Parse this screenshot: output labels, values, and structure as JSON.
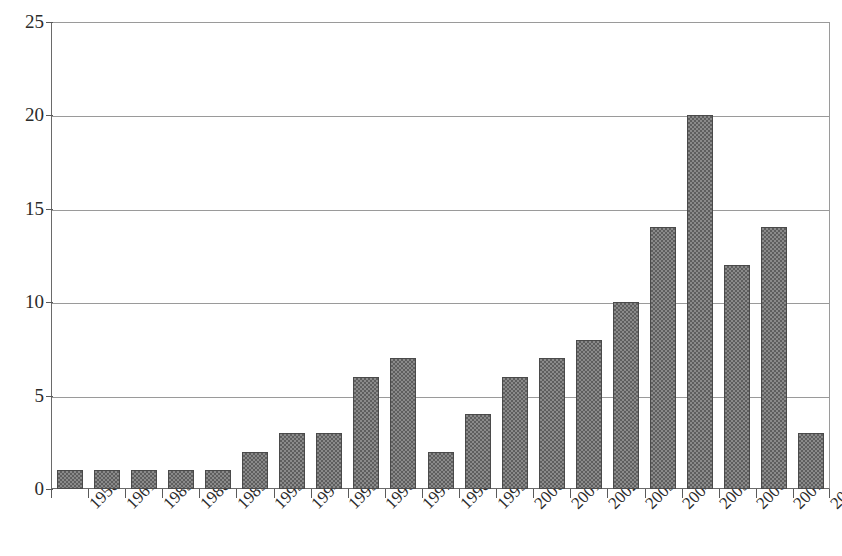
{
  "chart": {
    "title_remnant": ". .     . . . . .            . .    . . .",
    "background_color": "#ffffff",
    "bar_fill_color": "#8a8a8a",
    "bar_pattern_color": "#5e5e5e",
    "bar_border_color": "#4a4a4a",
    "gridline_color": "#9a9a9a",
    "axis_color": "#5a5a5a",
    "text_color": "#2b2b2b"
  },
  "chart_data": {
    "type": "bar",
    "title": "",
    "subtitle": "",
    "xlabel": "",
    "ylabel": "",
    "categories": [
      "1958",
      "1961",
      "1985",
      "1988",
      "1989",
      "1993",
      "1994",
      "1995",
      "1996",
      "1997",
      "1998",
      "1999",
      "2000",
      "2001",
      "2002",
      "2003",
      "2004",
      "2005",
      "2006",
      "2007",
      "2008"
    ],
    "values": [
      1,
      1,
      1,
      1,
      1,
      2,
      3,
      3,
      6,
      7,
      2,
      4,
      6,
      7,
      8,
      10,
      14,
      20,
      12,
      14,
      3
    ],
    "ylim": [
      0,
      25
    ],
    "yticks": [
      0,
      5,
      10,
      15,
      20,
      25
    ],
    "ytick_labels": [
      "0",
      "5",
      "10",
      "15",
      "20",
      "25"
    ],
    "grid": true,
    "grid_axis": "y",
    "legend": false,
    "legend_position": "none",
    "xtick_rotation": -45,
    "series": [
      {
        "name": "count",
        "values": [
          1,
          1,
          1,
          1,
          1,
          2,
          3,
          3,
          6,
          7,
          2,
          4,
          6,
          7,
          8,
          10,
          14,
          20,
          12,
          14,
          3
        ]
      }
    ]
  }
}
